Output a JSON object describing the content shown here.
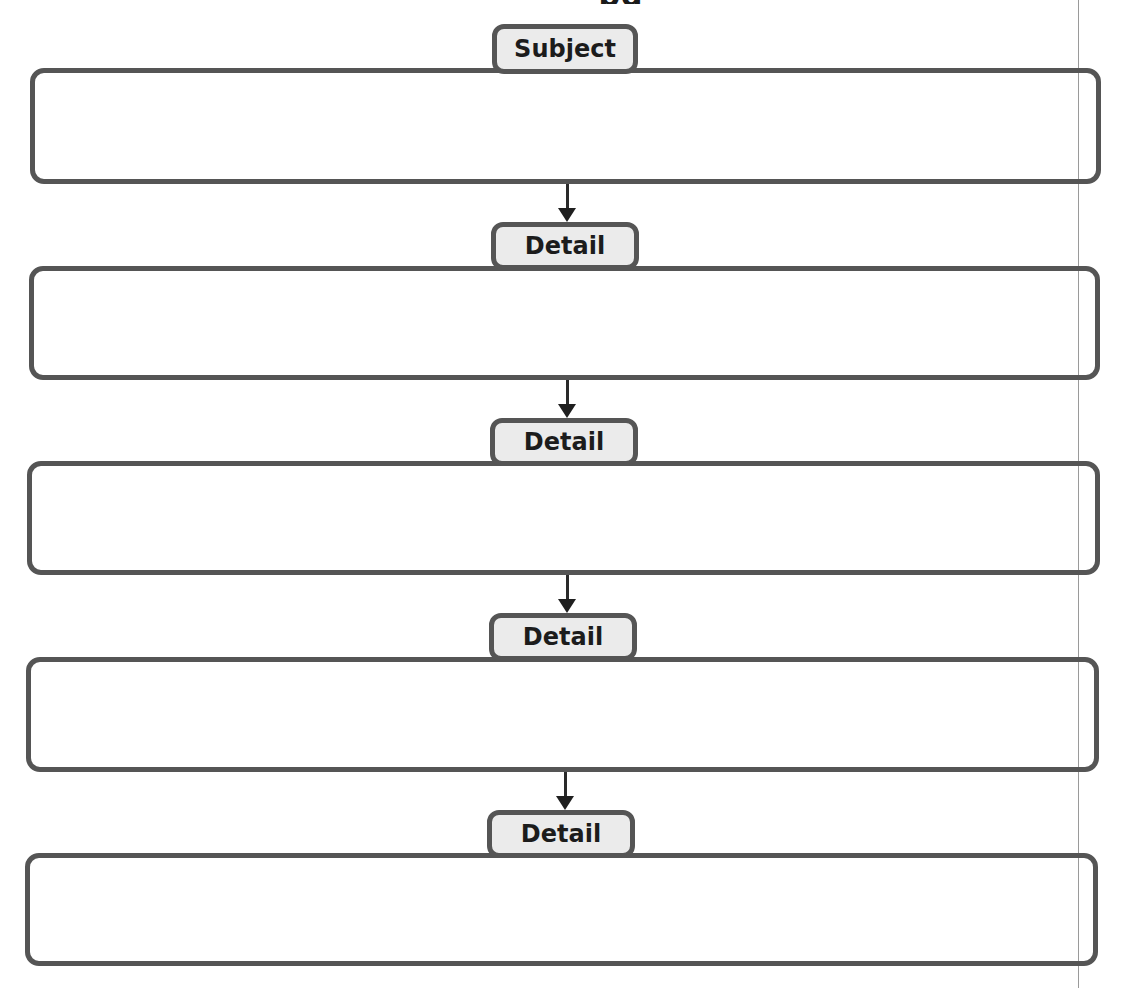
{
  "diagram": {
    "type": "sequential-organizer",
    "top_clipped_text": "pg",
    "nodes": [
      {
        "id": "subject",
        "label": "Subject",
        "content": ""
      },
      {
        "id": "detail-1",
        "label": "Detail",
        "content": ""
      },
      {
        "id": "detail-2",
        "label": "Detail",
        "content": ""
      },
      {
        "id": "detail-3",
        "label": "Detail",
        "content": ""
      },
      {
        "id": "detail-4",
        "label": "Detail",
        "content": ""
      }
    ],
    "edges": [
      {
        "from": "subject",
        "to": "detail-1"
      },
      {
        "from": "detail-1",
        "to": "detail-2"
      },
      {
        "from": "detail-2",
        "to": "detail-3"
      },
      {
        "from": "detail-3",
        "to": "detail-4"
      }
    ],
    "colors": {
      "border": "#555555",
      "tab_fill": "#ebebeb",
      "label_text": "#1c1c1c",
      "arrow": "#1f1f1f",
      "background": "#ffffff"
    }
  }
}
